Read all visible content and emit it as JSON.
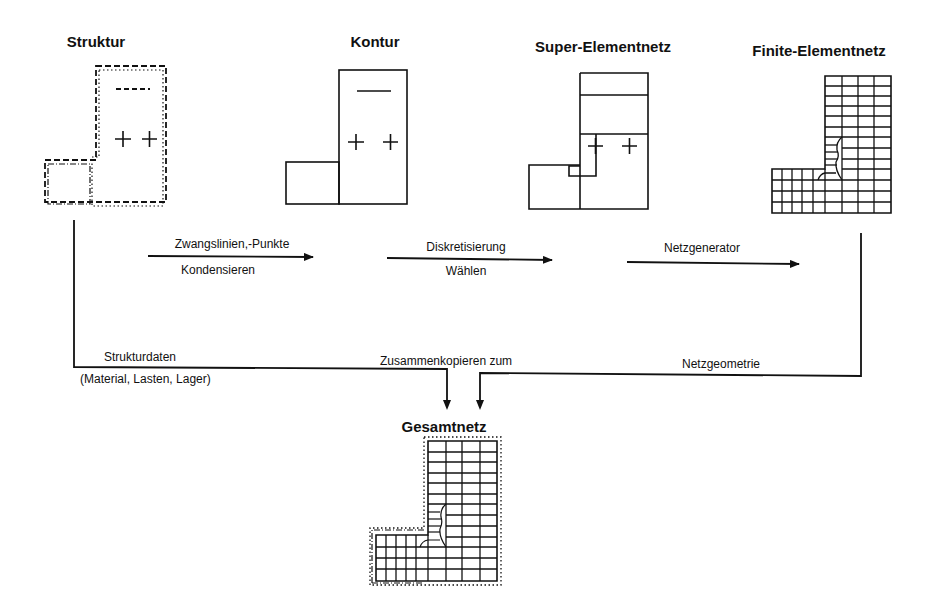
{
  "diagram": {
    "stages": [
      {
        "id": "struktur",
        "title": "Struktur"
      },
      {
        "id": "kontur",
        "title": "Kontur"
      },
      {
        "id": "super",
        "title": "Super-Elementnetz"
      },
      {
        "id": "finite",
        "title": "Finite-Elementnetz"
      }
    ],
    "arrows": [
      {
        "top": "Zwangslinien,-Punkte",
        "bottom": "Kondensieren"
      },
      {
        "top": "Diskretisierung",
        "bottom": "Wählen"
      },
      {
        "top": "Netzgenerator",
        "bottom": ""
      }
    ],
    "flow": {
      "left_label": "Strukturdaten",
      "left_sublabel": "(Material, Lasten, Lager)",
      "center_label": "Zusammenkopieren zum",
      "right_label": "Netzgeometrie"
    },
    "result": {
      "title": "Gesamtnetz"
    },
    "symbols": {
      "minus": "−",
      "plus": "+"
    }
  }
}
